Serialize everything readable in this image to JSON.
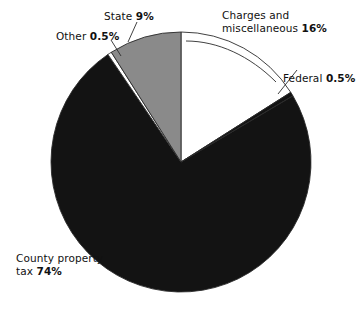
{
  "chart_data": {
    "type": "pie",
    "title": "",
    "subtitle": "",
    "xlabel": "",
    "ylabel": "",
    "legend_position": "callout-labels",
    "grid": false,
    "units": "percent",
    "total": 100,
    "start_angle_deg": 0,
    "direction": "clockwise",
    "categories": [
      "Charges and miscellaneous",
      "Federal",
      "County property tax",
      "Other",
      "State"
    ],
    "values": [
      16,
      0.5,
      74,
      0.5,
      9
    ],
    "slices": [
      {
        "name": "charges-and-miscellaneous",
        "label_line1": "Charges and",
        "label_line2": "miscellaneous",
        "value": 16,
        "value_text": "16%",
        "fill": "#ffffff",
        "start_deg": 0,
        "end_deg": 57.6
      },
      {
        "name": "federal",
        "label_line1": "Federal",
        "label_line2": "",
        "value": 0.5,
        "value_text": "0.5%",
        "fill": "#131313",
        "start_deg": 57.6,
        "end_deg": 59.4
      },
      {
        "name": "county-property-tax",
        "label_line1": "County property",
        "label_line2": "tax",
        "value": 74,
        "value_text": "74%",
        "fill": "#131313",
        "start_deg": 59.4,
        "end_deg": 325.8
      },
      {
        "name": "other",
        "label_line1": "Other",
        "label_line2": "",
        "value": 0.5,
        "value_text": "0.5%",
        "fill": "#ffffff",
        "start_deg": 325.8,
        "end_deg": 327.6
      },
      {
        "name": "state",
        "label_line1": "State",
        "label_line2": "",
        "value": 9,
        "value_text": "9%",
        "fill": "#8a8a8a",
        "start_deg": 327.6,
        "end_deg": 360
      }
    ],
    "colors": {
      "white_slice": "#ffffff",
      "black_slice": "#131313",
      "gray_slice": "#8a8a8a",
      "outline": "#2b2b2b",
      "background": "#ffffff",
      "text": "#111111"
    }
  },
  "labels": {
    "state": {
      "text": "State",
      "pct": "9%"
    },
    "other": {
      "text": "Other",
      "pct": "0.5%"
    },
    "charges": {
      "line1": "Charges and",
      "line2": "miscellaneous",
      "pct": "16%"
    },
    "federal": {
      "text": "Federal",
      "pct": "0.5%"
    },
    "county": {
      "line1": "County property",
      "line2": "tax",
      "pct": "74%"
    }
  }
}
